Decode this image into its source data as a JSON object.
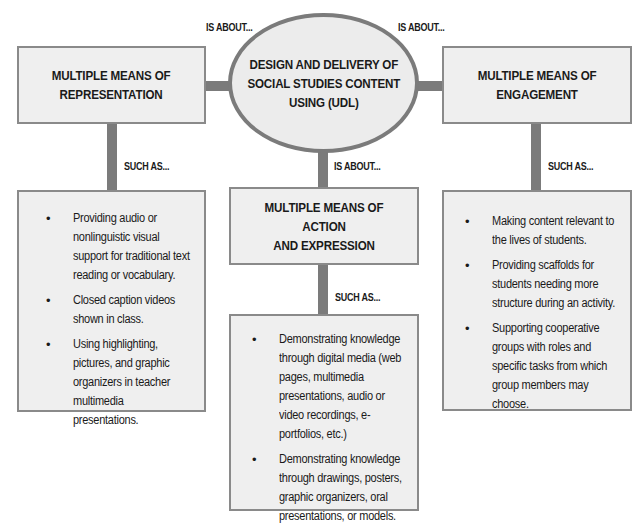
{
  "center": {
    "title": "DESIGN AND DELIVERY OF\nSOCIAL STUDIES CONTENT\nUSING (UDL)"
  },
  "connector_labels": {
    "is_about_left": "IS ABOUT...",
    "is_about_right": "IS ABOUT...",
    "is_about_bottom": "IS ABOUT...",
    "such_as_left": "SUCH AS...",
    "such_as_middle": "SUCH AS...",
    "such_as_right": "SUCH AS..."
  },
  "branches": {
    "representation": {
      "title": "MULTIPLE MEANS OF\nREPRESENTATION",
      "examples": [
        "Providing audio or nonlinguistic visual support for traditional text reading or vocabulary.",
        "Closed caption videos shown in class.",
        "Using highlighting, pictures, and graphic organizers in teacher multimedia presentations."
      ]
    },
    "action_expression": {
      "title": "MULTIPLE MEANS OF ACTION\nAND EXPRESSION",
      "examples": [
        "Demonstrating knowledge through digital media (web pages, multimedia presentations, audio or video recordings, e-portfolios, etc.)",
        "Demonstrating knowledge through drawings, posters, graphic organizers, oral presentations, or models."
      ]
    },
    "engagement": {
      "title": "MULTIPLE MEANS OF\nENGAGEMENT",
      "examples": [
        "Making content relevant to the lives of students.",
        "Providing scaffolds for students needing more structure during an activity.",
        "Supporting cooperative groups with roles and specific tasks from which group members may choose."
      ]
    }
  },
  "bullet_glyph": "•",
  "colors": {
    "box_fill": "#efefef",
    "box_border": "#8a8a8a",
    "connector": "#7b7b7b",
    "text": "#1a1a1a"
  }
}
